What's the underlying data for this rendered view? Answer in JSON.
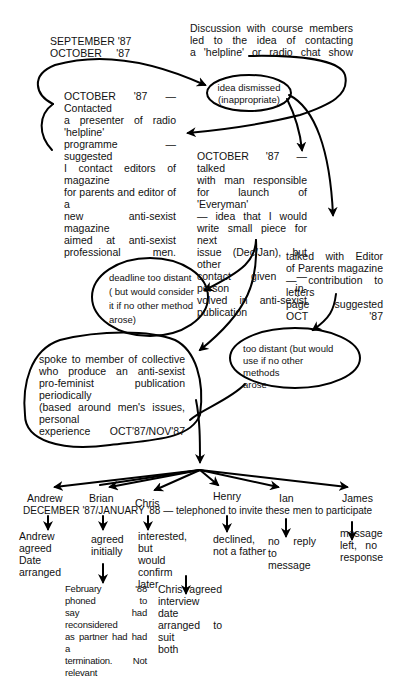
{
  "header": {
    "dates": [
      "SEPTEMBER '87",
      "OCTOBER     '87"
    ],
    "discussion": [
      "Discussion with course members",
      "led to the idea of contacting",
      "a 'helpline' or radio chat show"
    ]
  },
  "nodes": {
    "idea_dismissed": [
      "idea dismissed",
      "(inappropriate)"
    ],
    "radio_helpline": [
      "OCTOBER '87 — Contacted",
      "a presenter of radio 'helpline'",
      "programme — suggested",
      "I contact editors of magazine",
      "for parents and editor of a",
      "new anti-sexist magazine",
      "aimed at anti-sexist",
      "professional men."
    ],
    "everyman": [
      "OCTOBER '87 — talked",
      "with man responsible",
      "for launch of 'Everyman'",
      "— idea that I would",
      "write small piece for next",
      "issue (Dec/Jan), but other",
      "contact given — person in-",
      "volved in anti-sexist",
      "publication"
    ],
    "parents_editor": [
      "talked with Editor",
      "of Parents magazine",
      "— contribution to letters",
      "page suggested OCT '87"
    ],
    "deadline": [
      "deadline too distant",
      "( but would consider",
      "it if no other method",
      "arose)"
    ],
    "too_distant": [
      "too distant (but would",
      "use if no other methods",
      "arose"
    ],
    "collective": [
      "spoke to member of collective",
      "who produce an anti-sexist",
      "pro-feminist publication periodically",
      "(based around men's issues, personal",
      "experience",
      "OCT'87/NOV'87"
    ]
  },
  "participants": [
    {
      "name": "Andrew",
      "outcome": [
        "Andrew agreed",
        "Date arranged"
      ]
    },
    {
      "name": "Brian",
      "outcome": [
        "agreed",
        "initially"
      ],
      "followup": [
        "February '88 phoned to",
        "say had reconsidered",
        "as partner had had a",
        "termination. Not relevant"
      ]
    },
    {
      "name": "Chris",
      "outcome": [
        "interested, but",
        "would confirm",
        "later"
      ],
      "followup": [
        "Chris agreed",
        "interview date",
        "arranged to suit",
        "both"
      ]
    },
    {
      "name": "Henry",
      "outcome": [
        "declined,",
        "not a father"
      ]
    },
    {
      "name": "Ian",
      "outcome": [
        "no reply",
        "to message"
      ]
    },
    {
      "name": "James",
      "outcome": [
        "message",
        "left, no",
        "response"
      ]
    }
  ],
  "telephone_line": "DECEMBER '87/JANUARY '88 — telephoned to invite these men to participate"
}
